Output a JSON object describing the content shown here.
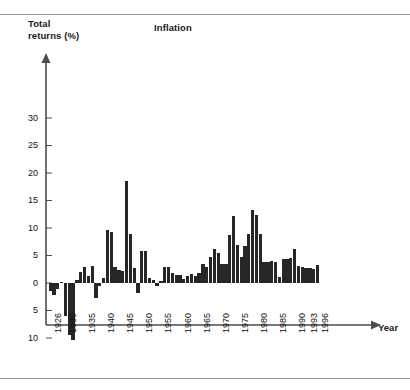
{
  "figure": {
    "title": "Inflation",
    "y_axis_label": "Total\nreturns (%)",
    "x_axis_label": "Year",
    "bar_color": "#262626",
    "axis_color": "#4d4d4d",
    "background": "#ffffff"
  },
  "chart_data": {
    "type": "bar",
    "title": "Inflation",
    "xlabel": "Year",
    "ylabel": "Total returns (%)",
    "ylim": [
      -10,
      32
    ],
    "xlim": [
      1926,
      1996
    ],
    "grid": false,
    "legend": "none",
    "ytick_labels": [
      "30",
      "25",
      "20",
      "15",
      "10",
      "5",
      "0",
      "5",
      "10"
    ],
    "ytick_values": [
      30,
      25,
      20,
      15,
      10,
      5,
      0,
      -5,
      -10
    ],
    "xtick_labels": [
      "1926",
      "1930",
      "1935",
      "1940",
      "1945",
      "1950",
      "1955",
      "1960",
      "1965",
      "1970",
      "1975",
      "1980",
      "1985",
      "1990",
      "1993",
      "1996"
    ],
    "categories": [
      1926,
      1927,
      1928,
      1929,
      1930,
      1931,
      1932,
      1933,
      1934,
      1935,
      1936,
      1937,
      1938,
      1939,
      1940,
      1941,
      1942,
      1943,
      1944,
      1945,
      1946,
      1947,
      1948,
      1949,
      1950,
      1951,
      1952,
      1953,
      1954,
      1955,
      1956,
      1957,
      1958,
      1959,
      1960,
      1961,
      1962,
      1963,
      1964,
      1965,
      1966,
      1967,
      1968,
      1969,
      1970,
      1971,
      1972,
      1973,
      1974,
      1975,
      1976,
      1977,
      1978,
      1979,
      1980,
      1981,
      1982,
      1983,
      1984,
      1985,
      1986,
      1987,
      1988,
      1989,
      1990,
      1991,
      1992,
      1993,
      1994,
      1995,
      1996
    ],
    "values": [
      -1.5,
      -2.1,
      -1.0,
      0.2,
      -6.0,
      -9.5,
      -10.3,
      0.5,
      2.0,
      3.0,
      1.2,
      3.1,
      -2.8,
      -0.5,
      1.0,
      9.7,
      9.3,
      3.0,
      2.3,
      2.2,
      18.6,
      9.0,
      2.7,
      -1.8,
      5.8,
      5.9,
      0.9,
      0.6,
      -0.5,
      0.4,
      2.9,
      3.0,
      1.8,
      1.5,
      1.5,
      0.7,
      1.2,
      1.6,
      1.2,
      1.9,
      3.4,
      3.0,
      4.7,
      6.1,
      5.5,
      3.4,
      3.4,
      8.8,
      12.2,
      7.0,
      4.8,
      6.8,
      9.0,
      13.3,
      12.4,
      8.9,
      3.9,
      3.8,
      4.0,
      3.8,
      1.1,
      4.4,
      4.4,
      4.6,
      6.1,
      3.1,
      2.9,
      2.7,
      2.7,
      2.5,
      3.3
    ]
  }
}
